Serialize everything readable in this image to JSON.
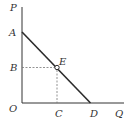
{
  "diagram": {
    "type": "demand-curve",
    "axes": {
      "y_label": "P",
      "x_label": "Q",
      "origin_label": "O"
    },
    "points": {
      "A": "A",
      "B": "B",
      "C": "C",
      "D": "D",
      "E": "E"
    },
    "colors": {
      "axis": "#333333",
      "line": "#2b2b2b",
      "dashed": "#777777",
      "text": "#333333"
    }
  }
}
